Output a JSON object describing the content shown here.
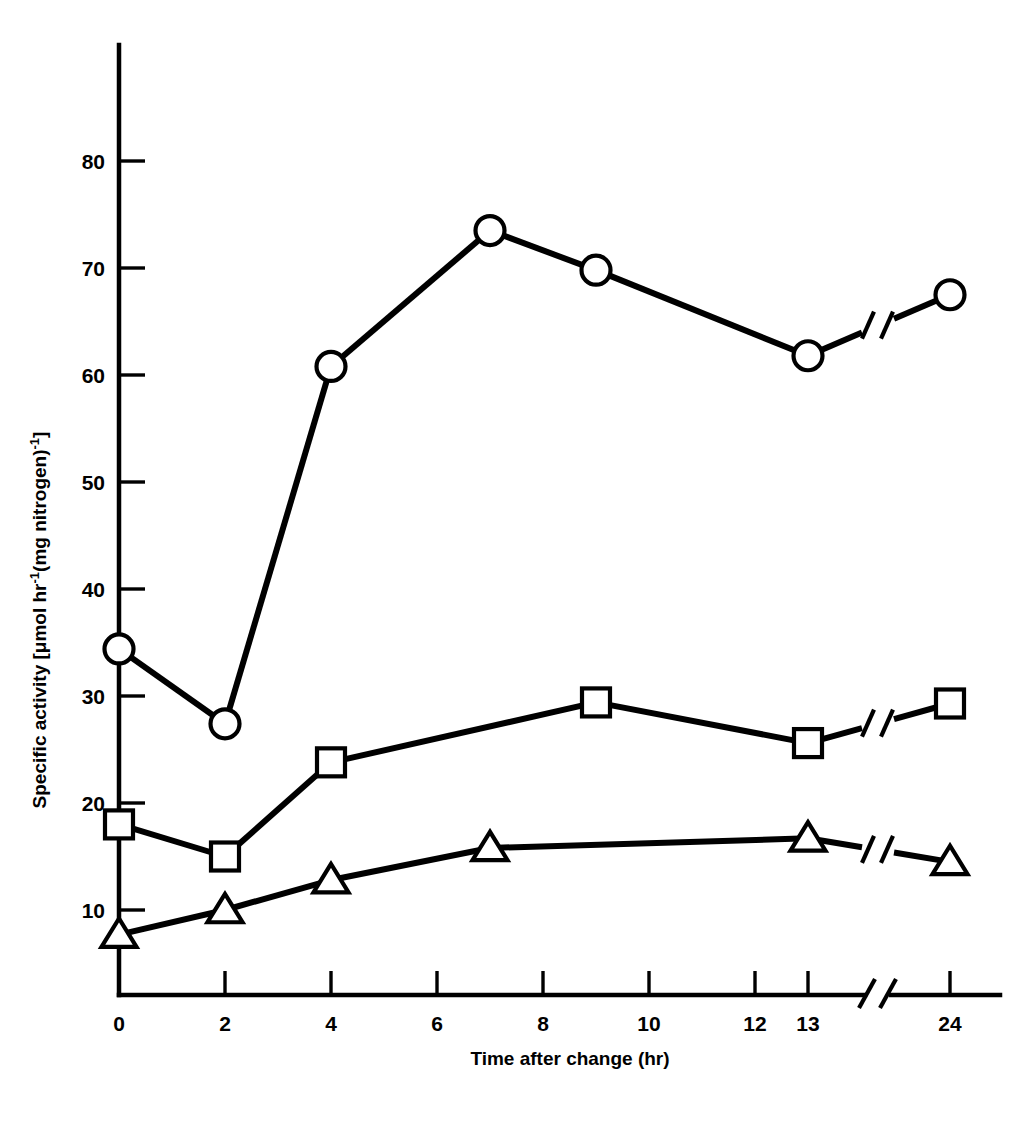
{
  "figure": {
    "background_color": "#ffffff",
    "ink_color": "#000000",
    "title": ""
  },
  "chart_data": {
    "type": "line",
    "title": "",
    "xlabel": "Time after change (hr)",
    "ylabel": "Specific activity [μmol hr⁻¹(mg nitrogen)⁻¹]",
    "ylabel_parts": {
      "prefix": "Specific activity [",
      "unit_mu": "μmol hr",
      "sup1": "-1",
      "mid": "(mg nitrogen)",
      "sup2": "-1",
      "suffix": "]"
    },
    "x": [
      0,
      2,
      4,
      6,
      7,
      8,
      9,
      10,
      12,
      13,
      24
    ],
    "xticks": [
      0,
      2,
      4,
      6,
      8,
      10,
      12,
      13,
      24
    ],
    "xtick_labels": [
      "0",
      "2",
      "4",
      "6",
      "8",
      "10",
      "12",
      "13",
      "24"
    ],
    "yticks": [
      10,
      20,
      30,
      40,
      50,
      60,
      70,
      80
    ],
    "ytick_labels": [
      "10",
      "20",
      "30",
      "40",
      "50",
      "60",
      "70",
      "80"
    ],
    "xlim": [
      0,
      24
    ],
    "ylim": [
      0,
      87
    ],
    "grid": false,
    "legend": false,
    "axis_break": {
      "present": true,
      "between": [
        13,
        24
      ],
      "style": "double-slash",
      "on_x_axis": true,
      "on_series_lines": true
    },
    "series": [
      {
        "name": "open-circle-series",
        "marker": "circle",
        "marker_fill": "#ffffff",
        "marker_stroke": "#000000",
        "x": [
          0,
          2,
          4,
          7,
          9,
          13,
          24
        ],
        "values": [
          34.4,
          27.4,
          60.8,
          73.5,
          69.8,
          61.8,
          67.5
        ]
      },
      {
        "name": "open-square-series",
        "marker": "square",
        "marker_fill": "#ffffff",
        "marker_stroke": "#000000",
        "x": [
          0,
          2,
          4,
          9,
          13,
          24
        ],
        "values": [
          18.0,
          15.0,
          23.8,
          29.4,
          25.6,
          29.3
        ]
      },
      {
        "name": "open-triangle-series",
        "marker": "triangle",
        "marker_fill": "#ffffff",
        "marker_stroke": "#000000",
        "x": [
          0,
          2,
          4,
          7,
          13,
          24
        ],
        "values": [
          7.7,
          10.0,
          12.8,
          15.8,
          16.7,
          14.5
        ]
      }
    ]
  }
}
